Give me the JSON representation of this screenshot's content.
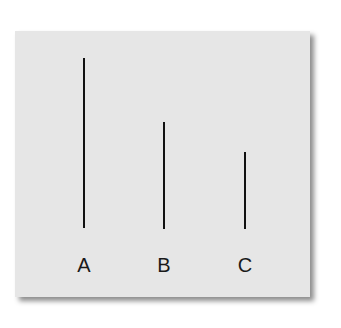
{
  "figure": {
    "lines": [
      {
        "label": "A",
        "x": 84,
        "top": 58,
        "bottom": 228
      },
      {
        "label": "B",
        "x": 164,
        "top": 122,
        "bottom": 229
      },
      {
        "label": "C",
        "x": 245,
        "top": 152,
        "bottom": 229
      }
    ],
    "colors": {
      "card": "#e6e6e6",
      "line": "#111111",
      "background": "#ffffff"
    }
  }
}
